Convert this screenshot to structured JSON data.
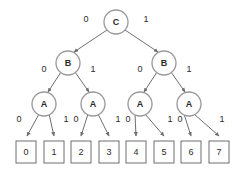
{
  "diagram": {
    "colors": {
      "background": "#ffffff",
      "node_stroke": "#9a9a9a",
      "leaf_stroke": "#6e6e6e",
      "edge_stroke": "#6e6e6e",
      "text": "#2b2b2b"
    },
    "levels": [
      {
        "name": "root",
        "nodes": [
          {
            "id": "c0",
            "label": "C",
            "cx": 116,
            "cy": 22,
            "r": 12
          }
        ]
      },
      {
        "name": "level-b",
        "nodes": [
          {
            "id": "b0",
            "label": "B",
            "cx": 68,
            "cy": 63,
            "r": 12
          },
          {
            "id": "b1",
            "label": "B",
            "cx": 164,
            "cy": 63,
            "r": 12
          }
        ]
      },
      {
        "name": "level-a",
        "nodes": [
          {
            "id": "a0",
            "label": "A",
            "cx": 44,
            "cy": 104,
            "r": 12
          },
          {
            "id": "a1",
            "label": "A",
            "cx": 93,
            "cy": 104,
            "r": 12
          },
          {
            "id": "a2",
            "label": "A",
            "cx": 140,
            "cy": 104,
            "r": 12
          },
          {
            "id": "a3",
            "label": "A",
            "cx": 189,
            "cy": 104,
            "r": 12
          }
        ]
      }
    ],
    "leaves": [
      {
        "id": "leaf0",
        "label": "0",
        "x": 16,
        "y": 141,
        "w": 20,
        "h": 22
      },
      {
        "id": "leaf1",
        "label": "1",
        "x": 44,
        "y": 141,
        "w": 20,
        "h": 22
      },
      {
        "id": "leaf2",
        "label": "2",
        "x": 71,
        "y": 141,
        "w": 20,
        "h": 22
      },
      {
        "id": "leaf3",
        "label": "3",
        "x": 99,
        "y": 141,
        "w": 20,
        "h": 22
      },
      {
        "id": "leaf4",
        "label": "4",
        "x": 126,
        "y": 141,
        "w": 20,
        "h": 22
      },
      {
        "id": "leaf5",
        "label": "5",
        "x": 154,
        "y": 141,
        "w": 20,
        "h": 22
      },
      {
        "id": "leaf6",
        "label": "6",
        "x": 181,
        "y": 141,
        "w": 20,
        "h": 22
      },
      {
        "id": "leaf7",
        "label": "7",
        "x": 209,
        "y": 141,
        "w": 20,
        "h": 22
      }
    ],
    "edges": [
      {
        "id": "e-c-b0",
        "from": "c0",
        "to": "b0",
        "x1": 107,
        "y1": 30,
        "x2": 74,
        "y2": 52,
        "label": "0",
        "lx": 86,
        "ly": 20
      },
      {
        "id": "e-c-b1",
        "from": "c0",
        "to": "b1",
        "x1": 125,
        "y1": 30,
        "x2": 158,
        "y2": 52,
        "label": "1",
        "lx": 146,
        "ly": 20
      },
      {
        "id": "e-b0-a0",
        "from": "b0",
        "to": "a0",
        "x1": 61,
        "y1": 72,
        "x2": 48,
        "y2": 92,
        "label": "0",
        "lx": 44,
        "ly": 70
      },
      {
        "id": "e-b0-a1",
        "from": "b0",
        "to": "a1",
        "x1": 75,
        "y1": 72,
        "x2": 89,
        "y2": 92,
        "label": "1",
        "lx": 93,
        "ly": 70
      },
      {
        "id": "e-b1-a2",
        "from": "b1",
        "to": "a2",
        "x1": 157,
        "y1": 72,
        "x2": 144,
        "y2": 92,
        "label": "0",
        "lx": 140,
        "ly": 70
      },
      {
        "id": "e-b1-a3",
        "from": "b1",
        "to": "a3",
        "x1": 171,
        "y1": 72,
        "x2": 185,
        "y2": 92,
        "label": "1",
        "lx": 189,
        "ly": 70
      },
      {
        "id": "e-a0-l0",
        "from": "a0",
        "to": "leaf0",
        "x1": 39,
        "y1": 114,
        "x2": 27,
        "y2": 136,
        "label": "0",
        "lx": 19,
        "ly": 120
      },
      {
        "id": "e-a0-l1",
        "from": "a0",
        "to": "leaf1",
        "x1": 49,
        "y1": 114,
        "x2": 54,
        "y2": 136,
        "label": "1",
        "lx": 66,
        "ly": 120
      },
      {
        "id": "e-a1-l2",
        "from": "a1",
        "to": "leaf2",
        "x1": 88,
        "y1": 114,
        "x2": 81,
        "y2": 136,
        "label": "0",
        "lx": 76,
        "ly": 120
      },
      {
        "id": "e-a1-l3",
        "from": "a1",
        "to": "leaf3",
        "x1": 98,
        "y1": 114,
        "x2": 109,
        "y2": 136,
        "label": "1",
        "lx": 118,
        "ly": 120
      },
      {
        "id": "e-a2-l4",
        "from": "a2",
        "to": "leaf4",
        "x1": 135,
        "y1": 114,
        "x2": 136,
        "y2": 136,
        "label": "0",
        "lx": 128,
        "ly": 120
      },
      {
        "id": "e-a2-l5",
        "from": "a2",
        "to": "leaf5",
        "x1": 145,
        "y1": 114,
        "x2": 164,
        "y2": 136,
        "label": "1",
        "lx": 170,
        "ly": 120
      },
      {
        "id": "e-a3-l6",
        "from": "a3",
        "to": "leaf6",
        "x1": 184,
        "y1": 114,
        "x2": 191,
        "y2": 136,
        "label": "0",
        "lx": 180,
        "ly": 120
      },
      {
        "id": "e-a3-l7",
        "from": "a3",
        "to": "leaf7",
        "x1": 194,
        "y1": 114,
        "x2": 219,
        "y2": 136,
        "label": "1",
        "lx": 222,
        "ly": 120
      }
    ]
  }
}
